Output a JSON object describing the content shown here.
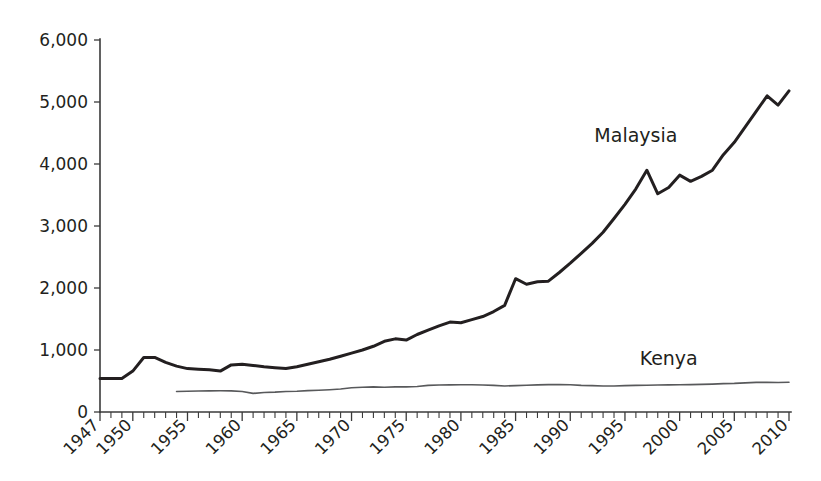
{
  "chart_data": {
    "type": "line",
    "title": "",
    "subtitle": "",
    "xlabel": "",
    "ylabel": "",
    "xlim": [
      1947,
      2010
    ],
    "ylim": [
      0,
      6000
    ],
    "grid": false,
    "legend_position": "inline-annotation",
    "y_ticks": [
      0,
      1000,
      2000,
      3000,
      4000,
      5000,
      6000
    ],
    "y_tick_labels": [
      "0",
      "1,000",
      "2,000",
      "3,000",
      "4,000",
      "5,000",
      "6,000"
    ],
    "x_ticks": [
      1947,
      1950,
      1955,
      1960,
      1965,
      1970,
      1975,
      1980,
      1985,
      1990,
      1995,
      2000,
      2005,
      2010
    ],
    "x_tick_labels": [
      "1947",
      "1950",
      "1955",
      "1960",
      "1965",
      "1970",
      "1975",
      "1980",
      "1985",
      "1990",
      "1995",
      "2000",
      "2005",
      "2010"
    ],
    "x_minor_tick_step": 1,
    "series": [
      {
        "name": "Malaysia",
        "color": "#231f20",
        "line_width": 3.0,
        "label_x": 1996,
        "label_y": 4350,
        "x": [
          1947,
          1948,
          1949,
          1950,
          1951,
          1952,
          1953,
          1954,
          1955,
          1956,
          1957,
          1958,
          1959,
          1960,
          1961,
          1962,
          1963,
          1964,
          1965,
          1966,
          1967,
          1968,
          1969,
          1970,
          1971,
          1972,
          1973,
          1974,
          1975,
          1976,
          1977,
          1978,
          1979,
          1980,
          1981,
          1982,
          1983,
          1984,
          1985,
          1986,
          1987,
          1988,
          1989,
          1990,
          1991,
          1992,
          1993,
          1994,
          1995,
          1996,
          1997,
          1998,
          1999,
          2000,
          2001,
          2002,
          2003,
          2004,
          2005,
          2006,
          2007,
          2008,
          2009,
          2010
        ],
        "y": [
          540,
          540,
          540,
          660,
          880,
          880,
          800,
          740,
          700,
          690,
          680,
          660,
          760,
          770,
          750,
          730,
          715,
          700,
          730,
          770,
          810,
          850,
          900,
          950,
          1000,
          1060,
          1140,
          1180,
          1160,
          1250,
          1320,
          1390,
          1450,
          1440,
          1490,
          1540,
          1620,
          1720,
          2150,
          2060,
          2100,
          2110,
          2250,
          2400,
          2560,
          2720,
          2900,
          3120,
          3350,
          3600,
          3900,
          3520,
          3620,
          3820,
          3720,
          3800,
          3900,
          4150,
          4350,
          4600,
          4850,
          5100,
          4950,
          5180
        ]
      },
      {
        "name": "Kenya",
        "color": "#58595b",
        "line_width": 1.6,
        "label_x": 1999,
        "label_y": 760,
        "x": [
          1954,
          1955,
          1956,
          1957,
          1958,
          1959,
          1960,
          1961,
          1962,
          1963,
          1964,
          1965,
          1966,
          1967,
          1968,
          1969,
          1970,
          1971,
          1972,
          1973,
          1974,
          1975,
          1976,
          1977,
          1978,
          1979,
          1980,
          1981,
          1982,
          1983,
          1984,
          1985,
          1986,
          1987,
          1988,
          1989,
          1990,
          1991,
          1992,
          1993,
          1994,
          1995,
          1996,
          1997,
          1998,
          1999,
          2000,
          2001,
          2002,
          2003,
          2004,
          2005,
          2006,
          2007,
          2008,
          2009,
          2010
        ],
        "y": [
          330,
          335,
          338,
          340,
          342,
          340,
          330,
          300,
          315,
          320,
          330,
          335,
          345,
          350,
          358,
          370,
          390,
          400,
          405,
          400,
          405,
          405,
          412,
          430,
          435,
          438,
          440,
          440,
          435,
          430,
          420,
          425,
          432,
          438,
          442,
          442,
          440,
          430,
          425,
          420,
          420,
          425,
          430,
          432,
          435,
          438,
          440,
          442,
          445,
          450,
          458,
          462,
          470,
          478,
          478,
          475,
          480
        ]
      }
    ]
  },
  "annotations": {
    "malaysia_label": "Malaysia",
    "kenya_label": "Kenya"
  }
}
